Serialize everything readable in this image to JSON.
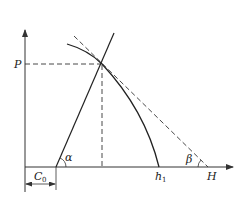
{
  "diagram": {
    "type": "characteristic-curve-diagram",
    "axes": {
      "y_axis_label": "P",
      "x_axis_label": "H"
    },
    "labels": {
      "p": "P",
      "h": "H",
      "h1_main": "h",
      "h1_sub": "1",
      "c0_main": "C",
      "c0_sub": "0",
      "alpha": "α",
      "beta": "β"
    },
    "elements": [
      {
        "name": "y-axis",
        "style": "solid-arrow"
      },
      {
        "name": "x-axis",
        "style": "solid-arrow"
      },
      {
        "name": "stiffness-line",
        "style": "solid",
        "angle_label": "α"
      },
      {
        "name": "characteristic-curve",
        "style": "solid",
        "ends_at": "h1"
      },
      {
        "name": "tangent-line",
        "style": "dashed",
        "angle_label": "β",
        "ends_at": "H"
      },
      {
        "name": "p-projection",
        "style": "dashed"
      },
      {
        "name": "vertical-projection",
        "style": "dashed"
      },
      {
        "name": "c0-dimension",
        "style": "double-arrow"
      }
    ],
    "colors": {
      "line": "#333333",
      "background": "#ffffff"
    }
  }
}
